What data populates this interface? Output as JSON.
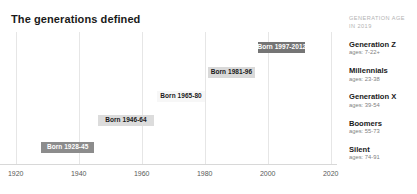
{
  "title": "The generations defined",
  "legend": {
    "header_line1": "GENERATION AGE",
    "header_line2": "IN 2019",
    "entries": [
      {
        "name": "Generation Z",
        "ages": "ages: 7-22+"
      },
      {
        "name": "Millennials",
        "ages": "ages: 23-38"
      },
      {
        "name": "Generation X",
        "ages": "ages: 39-54"
      },
      {
        "name": "Boomers",
        "ages": "ages: 55-73"
      },
      {
        "name": "Silent",
        "ages": "ages: 74-91"
      }
    ]
  },
  "chart_data": {
    "type": "bar",
    "orientation": "horizontal",
    "title": "The generations defined",
    "xlabel": "",
    "ylabel": "",
    "xlim": [
      1915,
      2022
    ],
    "ticks": [
      "1920",
      "1940",
      "1960",
      "1980",
      "2000",
      "2020"
    ],
    "tick_values": [
      1920,
      1940,
      1960,
      1980,
      2000,
      2020
    ],
    "grid": true,
    "legend_position": "right",
    "categories": [
      "Generation Z",
      "Millennials",
      "Generation X",
      "Boomers",
      "Silent"
    ],
    "bars": [
      {
        "name": "Generation Z",
        "label": "Born 1997-2012",
        "start": 1997,
        "end": 2012,
        "fill": "#757575",
        "text_color": "#ffffff"
      },
      {
        "name": "Millennials",
        "label": "Born 1981-96",
        "start": 1981,
        "end": 1996,
        "fill": "#d9d9d9",
        "text_color": "#1a1a1a"
      },
      {
        "name": "Generation X",
        "label": "Born 1965-80",
        "start": 1965,
        "end": 1980,
        "fill": "#f7f7f7",
        "text_color": "#1a1a1a"
      },
      {
        "name": "Boomers",
        "label": "Born 1946-64",
        "start": 1946,
        "end": 1964,
        "fill": "#dcdcdc",
        "text_color": "#1a1a1a"
      },
      {
        "name": "Silent",
        "label": "Born 1928-45",
        "start": 1928,
        "end": 1945,
        "fill": "#8c8c8c",
        "text_color": "#ffffff"
      }
    ]
  }
}
